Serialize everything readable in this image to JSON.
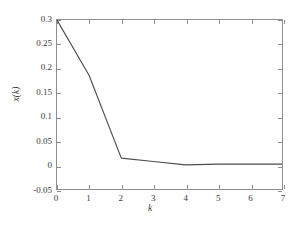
{
  "chart_data": {
    "type": "line",
    "title": "",
    "xlabel": "k",
    "ylabel": "x(k)",
    "x": [
      0,
      1,
      2,
      3,
      4,
      5,
      6,
      7
    ],
    "values": [
      0.3,
      0.185,
      0.014,
      0.007,
      0.0,
      0.0015,
      0.0015,
      0.0015
    ],
    "series": [
      {
        "name": "x(k)",
        "values": [
          0.3,
          0.185,
          0.014,
          0.007,
          0.0,
          0.0015,
          0.0015,
          0.0015
        ]
      }
    ],
    "xlim": [
      0,
      7
    ],
    "ylim": [
      -0.05,
      0.3
    ],
    "xticks": [
      0,
      1,
      2,
      3,
      4,
      5,
      6,
      7
    ],
    "xtick_labels": [
      "0",
      "1",
      "2",
      "3",
      "4",
      "5",
      "6",
      "7"
    ],
    "yticks": [
      -0.05,
      0,
      0.05,
      0.1,
      0.15,
      0.2,
      0.25,
      0.3
    ],
    "ytick_labels": [
      "-0.05",
      "0",
      "0.05",
      "0.1",
      "0.15",
      "0.2",
      "0.25",
      "0.3"
    ],
    "grid": false,
    "legend": null,
    "line_color": "#4d4d4d",
    "axis_color": "#8e8e8e",
    "background_color": "#ffffff"
  }
}
